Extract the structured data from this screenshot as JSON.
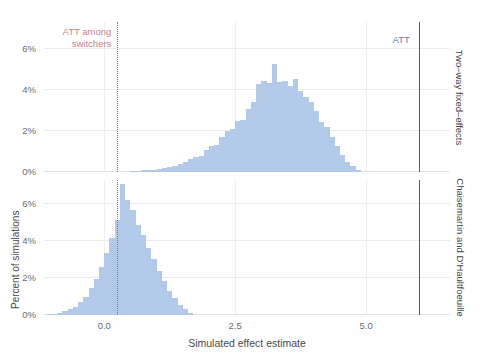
{
  "chart_data": {
    "type": "bar",
    "title": "",
    "subtitle": "",
    "xlabel": "Simulated effect estimate",
    "ylabel": "Percent of simulations",
    "xlim": [
      -1.15,
      6.6
    ],
    "ylim": [
      0,
      7.3
    ],
    "grid": true,
    "legend_position": "none",
    "xticks": [
      0.0,
      2.5,
      5.0
    ],
    "xticklabels": [
      "0.0",
      "2.5",
      "5.0"
    ],
    "yticks": [
      0,
      2,
      4,
      6
    ],
    "yticklabels": [
      "0%",
      "2%",
      "4%",
      "6%"
    ],
    "bin_width": 0.1,
    "annotations": [
      {
        "name": "att-among-switchers",
        "label": "ATT among switchers",
        "label_line1": "ATT among",
        "label_line2": "switchers",
        "x": 0.25,
        "style": "dotted",
        "color": "#c0606a",
        "panels": [
          "both"
        ]
      },
      {
        "name": "att",
        "label": "ATT",
        "x": 6.0,
        "style": "solid",
        "color": "#4c5a86",
        "panels": [
          "both"
        ]
      }
    ],
    "panels": [
      {
        "name": "two-way-fixed-effects",
        "strip_label": "Two–way fixed–effects",
        "bin_centers": [
          0.55,
          0.65,
          0.75,
          0.85,
          0.95,
          1.05,
          1.15,
          1.25,
          1.35,
          1.45,
          1.55,
          1.65,
          1.75,
          1.85,
          1.95,
          2.05,
          2.15,
          2.25,
          2.35,
          2.45,
          2.55,
          2.65,
          2.75,
          2.85,
          2.95,
          3.05,
          3.15,
          3.25,
          3.35,
          3.45,
          3.55,
          3.65,
          3.75,
          3.85,
          3.95,
          4.05,
          4.15,
          4.25,
          4.35,
          4.45,
          4.55,
          4.65,
          4.75,
          4.85
        ],
        "values": [
          0.04,
          0.06,
          0.08,
          0.1,
          0.12,
          0.15,
          0.18,
          0.22,
          0.3,
          0.38,
          0.48,
          0.62,
          0.72,
          0.8,
          1.05,
          1.28,
          1.3,
          1.7,
          2.0,
          2.08,
          2.5,
          2.55,
          3.05,
          3.4,
          4.3,
          4.45,
          4.35,
          5.25,
          4.4,
          4.45,
          4.2,
          4.55,
          3.95,
          3.65,
          3.4,
          2.95,
          2.45,
          2.2,
          1.7,
          1.25,
          0.85,
          0.5,
          0.28,
          0.12
        ],
        "peak_value": 5.25,
        "peak_x": 3.25,
        "center": 3.0
      },
      {
        "name": "chaisemartin-dhaultfoeuille",
        "strip_label": "Chaisemartin and D’Haultfoeuille",
        "bin_centers": [
          -1.05,
          -0.95,
          -0.85,
          -0.75,
          -0.65,
          -0.55,
          -0.45,
          -0.35,
          -0.25,
          -0.15,
          -0.05,
          0.05,
          0.15,
          0.25,
          0.35,
          0.45,
          0.55,
          0.65,
          0.75,
          0.85,
          0.95,
          1.05,
          1.15,
          1.25,
          1.35,
          1.45,
          1.55,
          1.65
        ],
        "values": [
          0.05,
          0.08,
          0.12,
          0.2,
          0.3,
          0.45,
          0.7,
          1.0,
          1.45,
          1.95,
          2.6,
          3.35,
          4.15,
          5.15,
          7.1,
          6.2,
          5.7,
          4.85,
          4.35,
          3.65,
          3.05,
          2.4,
          1.85,
          1.3,
          0.9,
          0.55,
          0.3,
          0.12
        ],
        "peak_value": 7.1,
        "peak_x": 0.35,
        "center": 0.25
      }
    ],
    "series_color": "#b3c9ea"
  }
}
